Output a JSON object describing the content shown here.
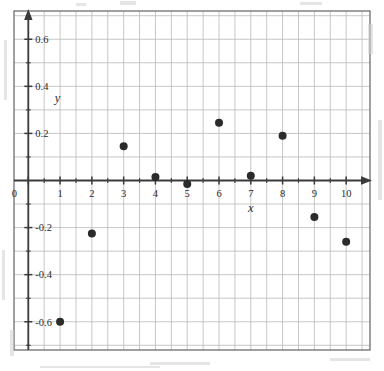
{
  "figure": {
    "name": "scatter-plot",
    "background": "#ffffff",
    "plot_border_color": "#6e6e6e",
    "grid_color": "#b9b9b9",
    "axis_color": "#3a3a3a",
    "point_color": "#2b2b2b"
  },
  "chart_data": {
    "type": "scatter",
    "title": "",
    "subtitle": "",
    "xlabel": "x",
    "ylabel": "y",
    "xlim": [
      -0.45,
      10.75
    ],
    "ylim": [
      -0.72,
      0.72
    ],
    "grid": true,
    "legend": null,
    "x_major_ticks": [
      0,
      1,
      2,
      3,
      4,
      5,
      6,
      7,
      8,
      9,
      10
    ],
    "x_tick_labels": [
      "0",
      "1",
      "2",
      "3",
      "4",
      "5",
      "6",
      "7",
      "8",
      "9",
      "10"
    ],
    "x_minor_tick_step": 0.5,
    "y_major_ticks": [
      -0.6,
      -0.4,
      -0.2,
      0.2,
      0.4,
      0.6
    ],
    "y_tick_labels": [
      "-0.6",
      "-0.4",
      "-0.2",
      "0.2",
      "0.4",
      "0.6"
    ],
    "y_minor_tick_step": 0.1,
    "y_gridline_step": 0.1,
    "origin_label": "0",
    "x": [
      1,
      2,
      3,
      4,
      5,
      6,
      7,
      8,
      9,
      10
    ],
    "y": [
      -0.6,
      -0.225,
      0.145,
      0.015,
      -0.015,
      0.245,
      0.02,
      0.19,
      -0.155,
      -0.26
    ],
    "points": [
      {
        "x": 1,
        "y": -0.6
      },
      {
        "x": 2,
        "y": -0.225
      },
      {
        "x": 3,
        "y": 0.145
      },
      {
        "x": 4,
        "y": 0.015
      },
      {
        "x": 5,
        "y": -0.015
      },
      {
        "x": 6,
        "y": 0.245
      },
      {
        "x": 7,
        "y": 0.02
      },
      {
        "x": 8,
        "y": 0.19
      },
      {
        "x": 9,
        "y": -0.155
      },
      {
        "x": 10,
        "y": -0.26
      }
    ],
    "marker": {
      "shape": "circle",
      "radius": 4,
      "filled": true
    }
  }
}
